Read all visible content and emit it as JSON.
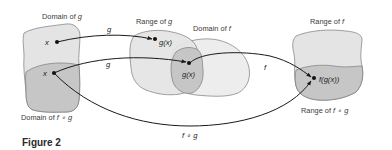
{
  "figure": {
    "caption": "Figure 2"
  },
  "sets": {
    "domain_g": {
      "label": "Domain of ",
      "var": "g"
    },
    "domain_fog": {
      "label": "Domain of ",
      "var": "f ∘ g"
    },
    "range_g": {
      "label": "Range of ",
      "var": "g"
    },
    "domain_f": {
      "label": "Domain of ",
      "var": "f"
    },
    "range_f": {
      "label": "Range of ",
      "var": "f"
    },
    "range_fog": {
      "label": "Range of ",
      "var": "f ∘ g"
    }
  },
  "points": {
    "x_top": "x",
    "x_bottom": "x",
    "gx_top": "g(x)",
    "gx_mid": "g(x)",
    "fgx": "f(g(x))"
  },
  "arrows": {
    "g_top": "g",
    "g_bottom": "g",
    "f": "f",
    "fog": "f ∘ g"
  },
  "colors": {
    "light_fill": "#e4e4e4",
    "dark_fill": "#c6c6c6",
    "outline": "#7a7a7a",
    "arrow": "#1a1a1a"
  }
}
